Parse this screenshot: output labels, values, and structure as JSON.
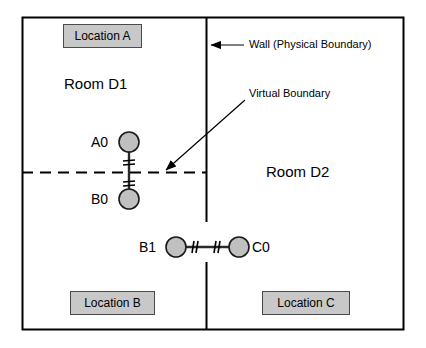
{
  "diagram": {
    "frame": {
      "x": 22,
      "y": 17,
      "width": 382,
      "height": 313
    },
    "colors": {
      "background": "#ffffff",
      "frame_stroke": "#000000",
      "box_fill": "#c8c8c8",
      "box_stroke": "#4a4a4a",
      "node_fill": "#c0c0c0",
      "node_stroke": "#1a1a1a",
      "line": "#000000"
    },
    "rooms": [
      {
        "id": "room-d1",
        "label": "Room D1",
        "x": 64,
        "y": 84
      },
      {
        "id": "room-d2",
        "label": "Room D2",
        "x": 266,
        "y": 172
      }
    ],
    "location_boxes": [
      {
        "id": "location-a",
        "label": "Location A",
        "x": 63,
        "y": 24,
        "width": 79,
        "height": 24
      },
      {
        "id": "location-b",
        "label": "Location B",
        "x": 70,
        "y": 291,
        "width": 85,
        "height": 24
      },
      {
        "id": "location-c",
        "label": "Location C",
        "x": 262,
        "y": 291,
        "width": 88,
        "height": 24
      }
    ],
    "nodes": [
      {
        "id": "a0",
        "label": "A0",
        "cx": 129,
        "cy": 142,
        "r": 10,
        "label_x": 96,
        "label_y": 142
      },
      {
        "id": "b0",
        "label": "B0",
        "cx": 129,
        "cy": 199,
        "r": 10,
        "label_x": 96,
        "label_y": 199
      },
      {
        "id": "b1",
        "label": "B1",
        "cx": 176,
        "cy": 247,
        "r": 10,
        "label_x": 144,
        "label_y": 247
      },
      {
        "id": "c0",
        "label": "C0",
        "cx": 239,
        "cy": 247,
        "r": 10,
        "label_x": 252,
        "label_y": 247
      }
    ],
    "links": [
      {
        "id": "link-a0-b0",
        "from": "a0",
        "to": "b0",
        "orientation": "vertical",
        "cut_marks": 2
      },
      {
        "id": "link-b1-c0",
        "from": "b1",
        "to": "c0",
        "orientation": "horizontal",
        "cut_marks": 2
      }
    ],
    "boundaries": [
      {
        "id": "wall",
        "kind": "physical",
        "style": "solid",
        "orientation": "vertical",
        "x": 206,
        "segments": [
          {
            "y1": 17,
            "y2": 222
          },
          {
            "y1": 262,
            "y2": 330
          }
        ]
      },
      {
        "id": "virtual-boundary",
        "kind": "virtual",
        "style": "dashed",
        "orientation": "horizontal",
        "y": 172,
        "x1": 22,
        "x2": 206
      }
    ],
    "annotations": [
      {
        "id": "wall-annotation",
        "label": "Wall (Physical Boundary)",
        "label_x": 249,
        "label_y": 45,
        "arrow": {
          "x1": 244,
          "y1": 45,
          "x2": 209,
          "y2": 45
        }
      },
      {
        "id": "virtual-boundary-annotation",
        "label": "Virtual Boundary",
        "label_x": 249,
        "label_y": 94,
        "arrow": {
          "x1": 245,
          "y1": 100,
          "x2": 164,
          "y2": 171
        }
      }
    ]
  }
}
